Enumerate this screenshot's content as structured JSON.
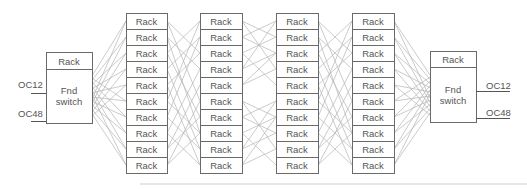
{
  "diagram": {
    "colors": {
      "box_stroke": "#6a6a6a",
      "text": "#555555",
      "link": "#b4b4b4",
      "rule": "#cfcfcf"
    },
    "rack_label": "Rack",
    "rows_per_column": 10,
    "rack_columns": [
      {
        "id": "col-1",
        "x": 126,
        "width": 41
      },
      {
        "id": "col-2",
        "x": 200,
        "width": 42
      },
      {
        "id": "col-3",
        "x": 276,
        "width": 42
      },
      {
        "id": "col-4",
        "x": 352,
        "width": 42
      }
    ],
    "rack_top": 13,
    "rack_row_height": 16,
    "switches": [
      {
        "id": "left-switch",
        "x": 46,
        "y": 52,
        "width": 46,
        "height": 71,
        "header_height": 17,
        "header_label": "Rack",
        "label_line1": "Fnd",
        "label_line2": "switch",
        "ports": [
          {
            "label": "OC12",
            "text_x": 18,
            "text_y": 88,
            "line_x1": 31,
            "line_x2": 46,
            "line_y": 93
          },
          {
            "label": "OC48",
            "text_x": 18,
            "text_y": 117,
            "line_x1": 31,
            "line_x2": 46,
            "line_y": 121
          }
        ]
      },
      {
        "id": "right-switch",
        "x": 430,
        "y": 51,
        "width": 46,
        "height": 71,
        "header_height": 16,
        "header_label": "Rack",
        "label_line1": "Fnd",
        "label_line2": "switch",
        "ports": [
          {
            "label": "OC12",
            "text_x": 486,
            "text_y": 89,
            "line_x1": 476,
            "line_x2": 510,
            "line_y": 91
          },
          {
            "label": "OC48",
            "text_x": 486,
            "text_y": 116,
            "line_x1": 476,
            "line_x2": 510,
            "line_y": 118
          }
        ]
      }
    ],
    "switch_links": {
      "left": {
        "edge_x": 92,
        "y_start": 76,
        "y_end": 116
      },
      "right": {
        "edge_x": 430,
        "y_start": 75,
        "y_end": 115
      }
    },
    "inter_column_links": [
      {
        "from": 0,
        "to": 1,
        "pattern": "long",
        "pairs": [
          [
            0,
            2
          ],
          [
            0,
            5
          ],
          [
            1,
            3
          ],
          [
            1,
            7
          ],
          [
            2,
            0
          ],
          [
            2,
            6
          ],
          [
            3,
            1
          ],
          [
            3,
            8
          ],
          [
            4,
            2
          ],
          [
            4,
            9
          ],
          [
            5,
            0
          ],
          [
            5,
            7
          ],
          [
            6,
            1
          ],
          [
            6,
            8
          ],
          [
            7,
            3
          ],
          [
            7,
            9
          ],
          [
            8,
            4
          ],
          [
            8,
            6
          ],
          [
            9,
            5
          ],
          [
            9,
            7
          ]
        ]
      },
      {
        "from": 1,
        "to": 2,
        "pattern": "local",
        "pairs": [
          [
            0,
            1
          ],
          [
            0,
            3
          ],
          [
            1,
            0
          ],
          [
            1,
            2
          ],
          [
            2,
            1
          ],
          [
            2,
            4
          ],
          [
            3,
            0
          ],
          [
            3,
            2
          ],
          [
            4,
            3
          ],
          [
            4,
            2
          ],
          [
            5,
            6
          ],
          [
            5,
            8
          ],
          [
            6,
            5
          ],
          [
            6,
            7
          ],
          [
            7,
            6
          ],
          [
            7,
            9
          ],
          [
            8,
            5
          ],
          [
            8,
            7
          ],
          [
            9,
            8
          ],
          [
            9,
            6
          ]
        ]
      },
      {
        "from": 2,
        "to": 3,
        "pattern": "long",
        "pairs": [
          [
            0,
            2
          ],
          [
            0,
            5
          ],
          [
            1,
            3
          ],
          [
            1,
            7
          ],
          [
            2,
            0
          ],
          [
            2,
            6
          ],
          [
            3,
            1
          ],
          [
            3,
            8
          ],
          [
            4,
            2
          ],
          [
            4,
            9
          ],
          [
            5,
            0
          ],
          [
            5,
            7
          ],
          [
            6,
            1
          ],
          [
            6,
            8
          ],
          [
            7,
            3
          ],
          [
            7,
            9
          ],
          [
            8,
            4
          ],
          [
            8,
            6
          ],
          [
            9,
            5
          ],
          [
            9,
            7
          ]
        ]
      }
    ],
    "bottom_rule": {
      "x1": 140,
      "x2": 527,
      "y": 184
    }
  }
}
